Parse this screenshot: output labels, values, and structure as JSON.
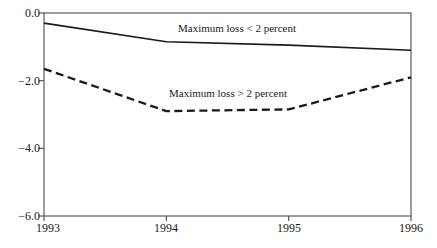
{
  "chart_data": {
    "type": "line",
    "title": "",
    "xlabel": "",
    "ylabel": "",
    "grid": false,
    "legend_position": "inline-annotations",
    "background_color": "#ffffff",
    "axis_color": "#4d4d4d",
    "line_color": "#1a1a1a",
    "x": [
      1993,
      1994,
      1995,
      1996
    ],
    "xtick_labels": [
      "1993",
      "1994",
      "1995",
      "1996"
    ],
    "ytick_values": [
      0,
      -2,
      -4,
      -6
    ],
    "ytick_labels": [
      "0.0",
      "−2.0",
      "−4.0",
      "−6.0"
    ],
    "ylim": [
      -6.0,
      0.0
    ],
    "xlim": [
      1993,
      1996
    ],
    "series": [
      {
        "name": "Maximum loss < 2 percent",
        "line_style": "solid",
        "color": "#1a1a1a",
        "values": [
          -0.3,
          -0.85,
          -0.95,
          -1.1
        ]
      },
      {
        "name": "Maximum loss > 2 percent",
        "line_style": "dashed",
        "color": "#1a1a1a",
        "values": [
          -1.65,
          -2.9,
          -2.85,
          -1.9
        ]
      }
    ]
  }
}
